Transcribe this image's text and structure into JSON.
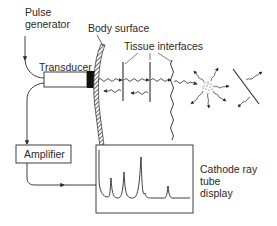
{
  "labels": {
    "pulse_generator_line1": "Pulse",
    "pulse_generator_line2": "generator",
    "transducer": "Transducer",
    "body_surface": "Body surface",
    "tissue_interfaces": "Tissue interfaces",
    "amplifier": "Amplifier",
    "crt_line1": "Cathode ray",
    "crt_line2": "tube",
    "crt_line3": "display"
  },
  "colors": {
    "ink": "#2a2a2a",
    "background": "#ffffff",
    "transducer_face": "#111111"
  },
  "crt_trace": {
    "description": "Echo peaks displayed on the cathode ray tube",
    "peaks": [
      {
        "position": "initial pulse",
        "relative_height": 0.95
      },
      {
        "position": "echo 1",
        "relative_height": 0.35
      },
      {
        "position": "echo 2",
        "relative_height": 0.45
      },
      {
        "position": "echo 3",
        "relative_height": 0.82
      },
      {
        "position": "echo 4",
        "relative_height": 0.25
      }
    ]
  }
}
